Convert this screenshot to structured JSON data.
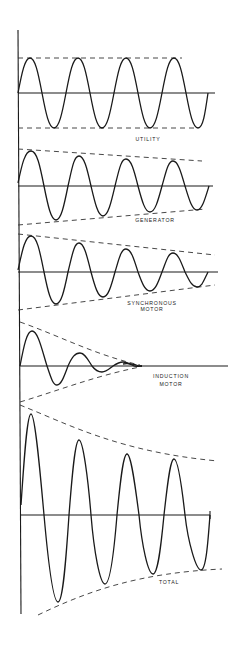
{
  "diagram": {
    "type": "waveform-stack",
    "panels": [
      {
        "id": "utility",
        "label_lines": [
          "UTILITY"
        ],
        "behavior": "constant amplitude"
      },
      {
        "id": "generator",
        "label_lines": [
          "GENERATOR"
        ],
        "behavior": "slowly decaying"
      },
      {
        "id": "synchronous-motor",
        "label_lines": [
          "SYNCHRONOUS",
          "MOTOR"
        ],
        "behavior": "decaying"
      },
      {
        "id": "induction-motor",
        "label_lines": [
          "INDUCTION",
          "MOTOR"
        ],
        "behavior": "rapidly decaying to zero"
      },
      {
        "id": "total",
        "label_lines": [
          "TOTAL"
        ],
        "behavior": "sum of contributions, decaying"
      }
    ]
  },
  "labels": {
    "utility": "UTILITY",
    "generator": "GENERATOR",
    "sync_1": "SYNCHRONOUS",
    "sync_2": "MOTOR",
    "induction_1": "INDUCTION",
    "induction_2": "MOTOR",
    "total": "TOTAL"
  },
  "colors": {
    "line": "#1a1a1a",
    "background": "#ffffff"
  }
}
